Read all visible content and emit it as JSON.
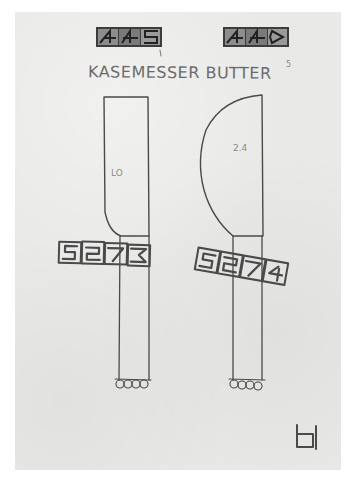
{
  "sketch": {
    "title": "KASEMESSER BUTTER",
    "superscript_mark": "5",
    "stamps_top": [
      {
        "label": "4 4 5",
        "position": "left"
      },
      {
        "label": "4 4 6",
        "position": "right"
      }
    ],
    "bands_handle": [
      {
        "label": "5 2 7 3",
        "position": "left"
      },
      {
        "label": "5 2 7 4",
        "position": "right"
      }
    ],
    "blade_notes": [
      {
        "text": "LO",
        "knife": "left"
      },
      {
        "text": "2.4",
        "knife": "right"
      }
    ],
    "knives": [
      {
        "name": "cheese-knife",
        "blade_shape": "rectangular with rounded lower-left corner"
      },
      {
        "name": "butter-knife",
        "blade_shape": "rounded D-shape"
      }
    ],
    "monogram": "H"
  },
  "colors": {
    "paper": "#e9e9e7",
    "background": "#ffffff",
    "pencil": "#4a4a4a",
    "stamp_fill": "#3a3a3a"
  }
}
